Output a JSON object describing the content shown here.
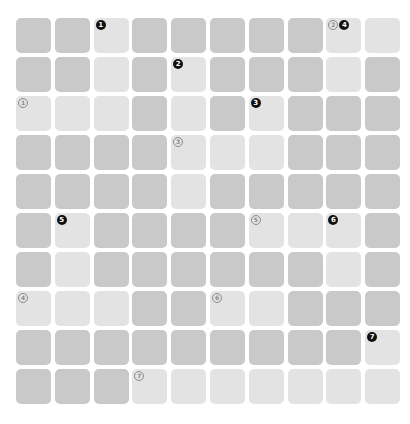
{
  "puzzle": {
    "rows": 10,
    "cols": 10,
    "colors": {
      "background": "#ffffff",
      "block_cell": "#c9c9c9",
      "open_cell": "#e3e3e3",
      "down_badge": "#111111",
      "across_badge": "#8a8a8a"
    },
    "grid": [
      "BBOBBBBBOO",
      "BBOBOBBBOB",
      "OOOBOBOBBB",
      "BBBBOOOBBB",
      "BBBBOBBBBB",
      "BOBBBBOOOB",
      "BOBBBBBBOB",
      "OOOBBOOBBB",
      "BBBBBBBBBO",
      "BBBOOOOOOO"
    ],
    "clues": [
      {
        "row": 0,
        "col": 2,
        "labels": [
          {
            "type": "down",
            "num": "1"
          }
        ]
      },
      {
        "row": 0,
        "col": 8,
        "labels": [
          {
            "type": "across",
            "num": "2"
          },
          {
            "type": "down",
            "num": "4"
          }
        ]
      },
      {
        "row": 1,
        "col": 4,
        "labels": [
          {
            "type": "down",
            "num": "2"
          }
        ]
      },
      {
        "row": 2,
        "col": 0,
        "labels": [
          {
            "type": "across",
            "num": "1"
          }
        ]
      },
      {
        "row": 2,
        "col": 6,
        "labels": [
          {
            "type": "down",
            "num": "3"
          }
        ]
      },
      {
        "row": 3,
        "col": 4,
        "labels": [
          {
            "type": "across",
            "num": "3"
          }
        ]
      },
      {
        "row": 5,
        "col": 1,
        "labels": [
          {
            "type": "down",
            "num": "5"
          }
        ]
      },
      {
        "row": 5,
        "col": 6,
        "labels": [
          {
            "type": "across",
            "num": "5"
          }
        ]
      },
      {
        "row": 5,
        "col": 8,
        "labels": [
          {
            "type": "down",
            "num": "6"
          }
        ]
      },
      {
        "row": 7,
        "col": 0,
        "labels": [
          {
            "type": "across",
            "num": "4"
          }
        ]
      },
      {
        "row": 7,
        "col": 5,
        "labels": [
          {
            "type": "across",
            "num": "6"
          }
        ]
      },
      {
        "row": 8,
        "col": 9,
        "labels": [
          {
            "type": "down",
            "num": "7"
          }
        ]
      },
      {
        "row": 9,
        "col": 3,
        "labels": [
          {
            "type": "across",
            "num": "7"
          }
        ]
      }
    ]
  }
}
